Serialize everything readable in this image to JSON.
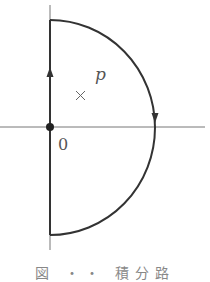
{
  "diagram": {
    "type": "contour-integration-path",
    "labels": {
      "pole": "p",
      "origin": "0",
      "pole_marker": "×"
    },
    "caption": "図 ・・ 積分路",
    "colors": {
      "path": "#333333",
      "axis": "#777777",
      "label": "#555555"
    }
  }
}
